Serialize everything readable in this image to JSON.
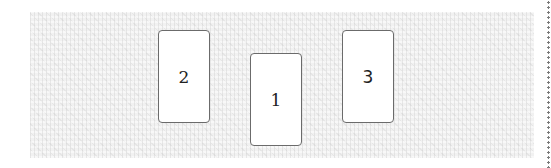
{
  "table": {
    "texture": "gray-fabric"
  },
  "cards": [
    {
      "id": "card-2",
      "label": "2",
      "left": 158,
      "top": 30,
      "font": "serif"
    },
    {
      "id": "card-1",
      "label": "1",
      "left": 250,
      "top": 53,
      "font": "serif"
    },
    {
      "id": "card-3",
      "label": "3",
      "left": 342,
      "top": 30,
      "font": "sans"
    }
  ],
  "colors": {
    "card_border": "#6b6b6b",
    "card_fill": "#ffffff",
    "table": "#f1f1f1",
    "dotted_edge": "#7a7a7a"
  }
}
